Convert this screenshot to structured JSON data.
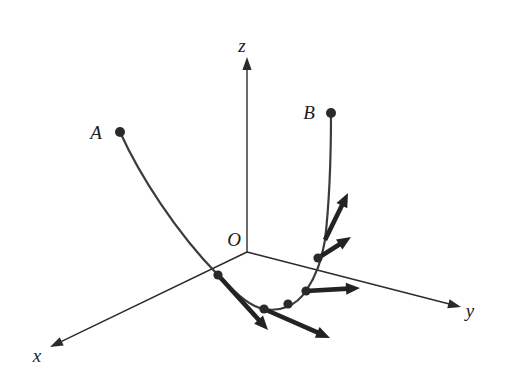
{
  "figure": {
    "background_color": "#ffffff",
    "width": 510,
    "height": 384
  },
  "axes": {
    "origin_label": "O",
    "origin": {
      "x": 247,
      "y": 252
    },
    "items": [
      {
        "name": "x-axis",
        "label": "x",
        "label_pos": {
          "x": 37,
          "y": 362
        },
        "from": {
          "x": 247,
          "y": 252
        },
        "to": {
          "x": 50,
          "y": 347
        },
        "arrow": "end"
      },
      {
        "name": "y-axis",
        "label": "y",
        "label_pos": {
          "x": 470,
          "y": 317
        },
        "from": {
          "x": 247,
          "y": 252
        },
        "to": {
          "x": 461,
          "y": 307
        },
        "arrow": "end"
      },
      {
        "name": "z-axis",
        "label": "z",
        "label_pos": {
          "x": 242,
          "y": 52
        },
        "from": {
          "x": 247,
          "y": 252
        },
        "to": {
          "x": 247,
          "y": 57
        },
        "arrow": "end"
      }
    ],
    "color": "#2b2b2b",
    "stroke_width": 1.4
  },
  "endpoints": [
    {
      "name": "point-A",
      "label": "A",
      "label_pos": {
        "x": 96,
        "y": 139
      },
      "dot": {
        "x": 120,
        "y": 132
      },
      "radius": 5
    },
    {
      "name": "point-B",
      "label": "B",
      "label_pos": {
        "x": 309,
        "y": 119
      },
      "dot": {
        "x": 331,
        "y": 113
      },
      "radius": 5
    }
  ],
  "curve": {
    "name": "space-curve-AB",
    "color": "#3c3c3c",
    "stroke_width": 2.2,
    "path": "M 120 132 C 140 176 176 232 218 275 C 240 298 252 307 264 309 C 280 312 296 306 306 291 C 316 276 321 262 325 240 C 329 206 331 160 331 113"
  },
  "tangent_vectors": {
    "color": "#232323",
    "stroke_width": 4.6,
    "head_length": 14,
    "head_width": 12,
    "items": [
      {
        "name": "tangent-vector-1",
        "base": {
          "x": 218,
          "y": 275
        },
        "tip": {
          "x": 268,
          "y": 330
        }
      },
      {
        "name": "tangent-vector-2",
        "base": {
          "x": 264,
          "y": 309
        },
        "tip": {
          "x": 330,
          "y": 338
        }
      },
      {
        "name": "tangent-vector-3",
        "base": {
          "x": 306,
          "y": 291
        },
        "tip": {
          "x": 360,
          "y": 288
        }
      },
      {
        "name": "tangent-vector-4",
        "base": {
          "x": 318,
          "y": 258
        },
        "tip": {
          "x": 351,
          "y": 237
        }
      },
      {
        "name": "tangent-vector-5",
        "base": {
          "x": 325,
          "y": 240
        },
        "tip": {
          "x": 348,
          "y": 193
        }
      }
    ]
  },
  "curve_points": {
    "color": "#2a2a2a",
    "radius": 4.6,
    "items": [
      {
        "name": "curve-point-1",
        "x": 218,
        "y": 275
      },
      {
        "name": "curve-point-2",
        "x": 264,
        "y": 309
      },
      {
        "name": "curve-point-3",
        "x": 288,
        "y": 304
      },
      {
        "name": "curve-point-4",
        "x": 306,
        "y": 291
      },
      {
        "name": "curve-point-5",
        "x": 318,
        "y": 258
      }
    ]
  }
}
